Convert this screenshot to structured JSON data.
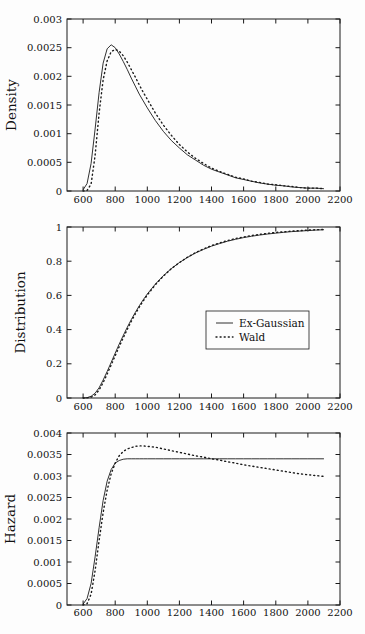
{
  "colors": {
    "background": "#fdfdfd",
    "line": "#1a1a1a",
    "text": "#111111"
  },
  "legend": {
    "entries": [
      {
        "label": "Ex-Gaussian",
        "style": "solid"
      },
      {
        "label": "Wald",
        "style": "dotted"
      }
    ]
  },
  "chart_data": [
    {
      "type": "line",
      "ylabel": "Density",
      "xlabel": "",
      "xlim": [
        500,
        2200
      ],
      "ylim": [
        0,
        0.003
      ],
      "xticks": [
        600,
        800,
        1000,
        1200,
        1400,
        1600,
        1800,
        2000,
        2200
      ],
      "xtick_labels": [
        "600",
        "800",
        "1000",
        "1200",
        "1400",
        "1600",
        "1800",
        "2000",
        "2200"
      ],
      "yticks": [
        0,
        0.0005,
        0.001,
        0.0015,
        0.002,
        0.0025,
        0.003
      ],
      "ytick_labels": [
        "0",
        "0.0005",
        "0.001",
        "0.0015",
        "0.002",
        "0.0025",
        "0.003"
      ],
      "show_legend": false,
      "x": [
        600,
        625,
        650,
        675,
        700,
        725,
        750,
        775,
        800,
        825,
        850,
        875,
        900,
        925,
        950,
        975,
        1000,
        1050,
        1100,
        1150,
        1200,
        1250,
        1300,
        1350,
        1400,
        1450,
        1500,
        1550,
        1600,
        1650,
        1700,
        1750,
        1800,
        1850,
        1900,
        1950,
        2000,
        2050,
        2100
      ],
      "series": [
        {
          "name": "Ex-Gaussian",
          "style": "solid",
          "y": [
            2e-05,
            0.00013,
            0.00048,
            0.00108,
            0.00172,
            0.00223,
            0.00248,
            0.00255,
            0.0025,
            0.00239,
            0.00226,
            0.00212,
            0.00197,
            0.00183,
            0.00169,
            0.00157,
            0.00145,
            0.00123,
            0.00104,
            0.00088,
            0.00075,
            0.00063,
            0.00054,
            0.00045,
            0.00038,
            0.00033,
            0.00028,
            0.00023,
            0.0002,
            0.00017,
            0.00014,
            0.00012,
            0.0001,
            9e-05,
            7e-05,
            6e-05,
            5e-05,
            5e-05,
            4e-05
          ]
        },
        {
          "name": "Wald",
          "style": "dotted",
          "y": [
            0,
            1e-05,
            0.00012,
            0.00062,
            0.00136,
            0.00194,
            0.00227,
            0.00243,
            0.00247,
            0.00244,
            0.00236,
            0.00225,
            0.00212,
            0.00199,
            0.00185,
            0.00172,
            0.0016,
            0.00136,
            0.00115,
            0.00097,
            0.00081,
            0.00068,
            0.00057,
            0.00048,
            0.0004,
            0.00034,
            0.00029,
            0.00024,
            0.00021,
            0.00017,
            0.00015,
            0.00012,
            0.00011,
            9e-05,
            8e-05,
            6e-05,
            5e-05,
            5e-05,
            4e-05
          ]
        }
      ]
    },
    {
      "type": "line",
      "ylabel": "Distribution",
      "xlabel": "",
      "xlim": [
        500,
        2200
      ],
      "ylim": [
        0,
        1
      ],
      "xticks": [
        600,
        800,
        1000,
        1200,
        1400,
        1600,
        1800,
        2000,
        2200
      ],
      "xtick_labels": [
        "600",
        "800",
        "1000",
        "1200",
        "1400",
        "1600",
        "1800",
        "2000",
        "2200"
      ],
      "yticks": [
        0,
        0.2,
        0.4,
        0.6,
        0.8,
        1
      ],
      "ytick_labels": [
        "0",
        "0.2",
        "0.4",
        "0.6",
        "0.8",
        "1"
      ],
      "show_legend": true,
      "x": [
        600,
        625,
        650,
        675,
        700,
        725,
        750,
        775,
        800,
        825,
        850,
        875,
        900,
        925,
        950,
        975,
        1000,
        1050,
        1100,
        1150,
        1200,
        1250,
        1300,
        1350,
        1400,
        1450,
        1500,
        1550,
        1600,
        1650,
        1700,
        1750,
        1800,
        1850,
        1900,
        1950,
        2000,
        2050,
        2100
      ],
      "series": [
        {
          "name": "Ex-Gaussian",
          "style": "solid",
          "y": [
            0.0,
            0.002,
            0.01,
            0.028,
            0.06,
            0.105,
            0.155,
            0.208,
            0.262,
            0.315,
            0.365,
            0.413,
            0.458,
            0.5,
            0.539,
            0.575,
            0.608,
            0.666,
            0.715,
            0.757,
            0.792,
            0.822,
            0.848,
            0.869,
            0.888,
            0.903,
            0.917,
            0.928,
            0.938,
            0.946,
            0.953,
            0.959,
            0.964,
            0.969,
            0.973,
            0.976,
            0.979,
            0.982,
            0.984
          ]
        },
        {
          "name": "Wald",
          "style": "dotted",
          "y": [
            0,
            0.001,
            0.005,
            0.018,
            0.047,
            0.09,
            0.14,
            0.193,
            0.247,
            0.3,
            0.352,
            0.401,
            0.448,
            0.491,
            0.531,
            0.568,
            0.602,
            0.662,
            0.713,
            0.756,
            0.792,
            0.823,
            0.85,
            0.872,
            0.891,
            0.907,
            0.921,
            0.933,
            0.942,
            0.95,
            0.957,
            0.963,
            0.968,
            0.972,
            0.976,
            0.979,
            0.982,
            0.984,
            0.986
          ]
        }
      ]
    },
    {
      "type": "line",
      "ylabel": "Hazard",
      "xlabel": "",
      "xlim": [
        500,
        2200
      ],
      "ylim": [
        0,
        0.004
      ],
      "xticks": [
        600,
        800,
        1000,
        1200,
        1400,
        1600,
        1800,
        2000,
        2200
      ],
      "xtick_labels": [
        "600",
        "800",
        "1000",
        "1200",
        "1400",
        "1600",
        "1800",
        "2000",
        "2200"
      ],
      "yticks": [
        0,
        0.0005,
        0.001,
        0.0015,
        0.002,
        0.0025,
        0.003,
        0.0035,
        0.004
      ],
      "ytick_labels": [
        "0",
        "0.0005",
        "0.001",
        "0.0015",
        "0.002",
        "0.0025",
        "0.003",
        "0.0035",
        "0.004"
      ],
      "show_legend": false,
      "x": [
        600,
        625,
        650,
        675,
        700,
        725,
        750,
        775,
        800,
        825,
        850,
        875,
        900,
        925,
        950,
        975,
        1000,
        1050,
        1100,
        1150,
        1200,
        1250,
        1300,
        1350,
        1400,
        1450,
        1500,
        1550,
        1600,
        1650,
        1700,
        1750,
        1800,
        1850,
        1900,
        1950,
        2000,
        2050,
        2100
      ],
      "series": [
        {
          "name": "Ex-Gaussian",
          "style": "solid",
          "y": [
            2e-05,
            0.00015,
            0.0005,
            0.00112,
            0.0018,
            0.00243,
            0.00288,
            0.00315,
            0.0033,
            0.00336,
            0.00339,
            0.0034,
            0.0034,
            0.0034,
            0.0034,
            0.0034,
            0.0034,
            0.0034,
            0.0034,
            0.0034,
            0.0034,
            0.0034,
            0.0034,
            0.0034,
            0.0034,
            0.0034,
            0.0034,
            0.0034,
            0.0034,
            0.0034,
            0.0034,
            0.0034,
            0.0034,
            0.0034,
            0.0034,
            0.0034,
            0.0034,
            0.0034,
            0.0034
          ]
        },
        {
          "name": "Wald",
          "style": "dotted",
          "y": [
            0,
            3e-05,
            0.00025,
            0.0008,
            0.0015,
            0.00215,
            0.00267,
            0.00305,
            0.0033,
            0.00347,
            0.00357,
            0.00363,
            0.00366,
            0.00369,
            0.0037,
            0.0037,
            0.00369,
            0.00367,
            0.00363,
            0.00359,
            0.00355,
            0.00351,
            0.00347,
            0.00344,
            0.0034,
            0.00337,
            0.00333,
            0.0033,
            0.00326,
            0.00323,
            0.0032,
            0.00317,
            0.00314,
            0.00311,
            0.00308,
            0.00305,
            0.00303,
            0.00301,
            0.00299
          ]
        }
      ]
    }
  ]
}
